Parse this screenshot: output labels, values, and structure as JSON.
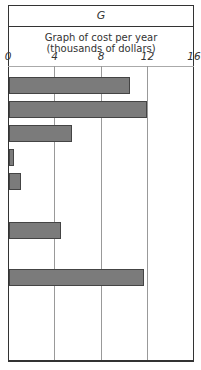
{
  "chart_data": {
    "type": "bar",
    "orientation": "horizontal",
    "title": "G",
    "subtitle_line1": "Graph of cost per year",
    "subtitle_line2": "(thousands of dollars)",
    "xlabel": "Graph of cost per year (thousands of dollars)",
    "ylabel": "",
    "xlim": [
      0,
      16
    ],
    "xticks": [
      "0",
      "4",
      "8",
      "12",
      "16"
    ],
    "grid": true,
    "categories": [
      "1",
      "2",
      "3",
      "4",
      "5",
      "6",
      "7",
      "8",
      "9",
      "10",
      "11"
    ],
    "values": [
      10.4,
      11.9,
      5.4,
      0.4,
      1.0,
      null,
      4.5,
      null,
      11.6,
      null,
      null
    ],
    "bar_color": "#7b7b7b"
  }
}
